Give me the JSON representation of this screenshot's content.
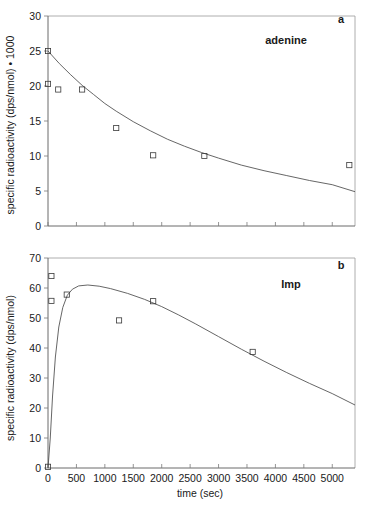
{
  "figure": {
    "background_color": "#ffffff",
    "ink_color": "#1a1a1a",
    "xlabel": "time (sec)"
  },
  "panels": [
    {
      "id": "a",
      "letter": "a",
      "series_label": "adenine",
      "ylabel": "specific radioactivity (dps/nmol)  • 1000"
    },
    {
      "id": "b",
      "letter": "b",
      "series_label": "Imp",
      "ylabel": "specific radioactivity  (dps/nmol)"
    }
  ],
  "chart_data": [
    {
      "type": "scatter",
      "panel": "a",
      "title": "adenine",
      "annotation": "a",
      "xlabel": "",
      "ylabel": "specific radioactivity (dps/nmol) • 1000",
      "xlim": [
        0,
        5400
      ],
      "ylim": [
        0,
        30
      ],
      "yticks": [
        0,
        5,
        10,
        15,
        20,
        25,
        30
      ],
      "ytick_labels": [
        "0",
        "5",
        "10",
        "15",
        "20",
        "25",
        "30"
      ],
      "xticks": [
        0,
        500,
        1000,
        1500,
        2000,
        2500,
        3000,
        3500,
        4000,
        4500,
        5000
      ],
      "xtick_labels": [],
      "grid": false,
      "legend": "none",
      "marker": "open-square",
      "series": [
        {
          "name": "adenine measured",
          "kind": "points",
          "x": [
            0,
            0,
            180,
            600,
            1200,
            1850,
            2750,
            5300
          ],
          "y": [
            25.0,
            20.3,
            19.5,
            19.5,
            14.0,
            10.1,
            10.0,
            8.7
          ]
        },
        {
          "name": "adenine fitted decay",
          "kind": "line",
          "x": [
            0,
            200,
            400,
            600,
            800,
            1000,
            1200,
            1500,
            1800,
            2100,
            2400,
            2700,
            3000,
            3400,
            3800,
            4200,
            4600,
            5000,
            5400
          ],
          "y": [
            25.0,
            23.2,
            21.6,
            20.1,
            18.8,
            17.5,
            16.4,
            14.9,
            13.6,
            12.4,
            11.4,
            10.5,
            9.7,
            8.7,
            7.9,
            7.2,
            6.5,
            5.9,
            4.9
          ]
        }
      ]
    },
    {
      "type": "scatter",
      "panel": "b",
      "title": "Imp",
      "annotation": "b",
      "xlabel": "time (sec)",
      "ylabel": "specific radioactivity (dps/nmol)",
      "xlim": [
        0,
        5400
      ],
      "ylim": [
        0,
        70
      ],
      "yticks": [
        0,
        10,
        20,
        30,
        40,
        50,
        60,
        70
      ],
      "ytick_labels": [
        "0",
        "10",
        "20",
        "30",
        "40",
        "50",
        "60",
        "70"
      ],
      "xticks": [
        0,
        500,
        1000,
        1500,
        2000,
        2500,
        3000,
        3500,
        4000,
        4500,
        5000
      ],
      "xtick_labels": [
        "0",
        "500",
        "1000",
        "1500",
        "2000",
        "2500",
        "3000",
        "3500",
        "4000",
        "4500",
        "5000"
      ],
      "grid": false,
      "legend": "none",
      "marker": "open-square",
      "series": [
        {
          "name": "Imp measured",
          "kind": "points",
          "x": [
            0,
            60,
            60,
            330,
            1250,
            1850,
            3600
          ],
          "y": [
            0.4,
            64.0,
            55.7,
            57.8,
            49.2,
            55.6,
            38.7
          ]
        },
        {
          "name": "Imp fitted curve",
          "kind": "line",
          "x": [
            0,
            40,
            80,
            130,
            190,
            260,
            340,
            430,
            540,
            700,
            900,
            1100,
            1400,
            1700,
            2000,
            2300,
            2600,
            3000,
            3400,
            3800,
            4200,
            4600,
            5000,
            5400
          ],
          "y": [
            0.0,
            10.0,
            24.0,
            37.0,
            47.0,
            53.5,
            57.6,
            59.6,
            60.7,
            61.0,
            60.6,
            59.8,
            58.2,
            56.2,
            53.8,
            51.0,
            48.0,
            43.8,
            39.6,
            35.6,
            31.8,
            28.2,
            24.8,
            21.0
          ]
        }
      ]
    }
  ]
}
